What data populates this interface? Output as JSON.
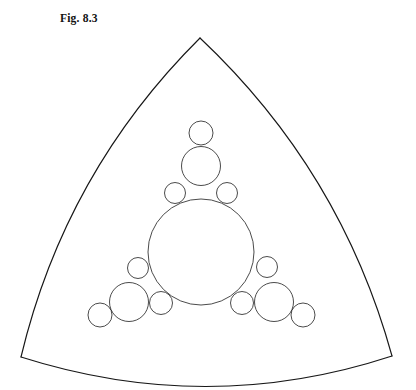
{
  "figure": {
    "caption": "Fig. 8.3",
    "background_color": "#ffffff",
    "stroke_color": "#2b2b2b",
    "boundary_color": "#171717",
    "canvas": {
      "width": 416,
      "height": 390
    }
  },
  "chart_data": {
    "type": "diagram",
    "title": "Fig. 8.3",
    "subtitle": "",
    "xlabel": "",
    "ylabel": "",
    "grid": false,
    "legend": "none",
    "axis_visible": false,
    "cusps": [
      {
        "name": "top-cusp",
        "x": 200,
        "y": 38
      },
      {
        "name": "bottom-left-cusp",
        "x": 21,
        "y": 357
      },
      {
        "name": "bottom-right-cusp",
        "x": 392,
        "y": 356
      }
    ],
    "boundary_arcs": [
      {
        "name": "left-arc",
        "from": "top-cusp",
        "to": "bottom-left-cusp",
        "bulge": 26
      },
      {
        "name": "right-arc",
        "from": "top-cusp",
        "to": "bottom-right-cusp",
        "bulge": 26
      },
      {
        "name": "bottom-arc",
        "from": "bottom-left-cusp",
        "to": "bottom-right-cusp",
        "bulge": 30
      }
    ],
    "circles": [
      {
        "name": "central-circle",
        "cx": 201,
        "cy": 252,
        "r": 53,
        "generation": 0
      },
      {
        "name": "upper-medium-circle",
        "cx": 201,
        "cy": 166,
        "r": 19.5,
        "generation": 1
      },
      {
        "name": "left-medium-circle",
        "cx": 129,
        "cy": 302,
        "r": 19.5,
        "generation": 1
      },
      {
        "name": "right-medium-circle",
        "cx": 274,
        "cy": 302,
        "r": 19.5,
        "generation": 1
      },
      {
        "name": "upper-small-circle",
        "cx": 201,
        "cy": 133,
        "r": 12,
        "generation": 2
      },
      {
        "name": "lower-left-small-circle",
        "cx": 100,
        "cy": 315,
        "r": 12,
        "generation": 2
      },
      {
        "name": "lower-right-small-circle",
        "cx": 303,
        "cy": 315,
        "r": 12,
        "generation": 2
      },
      {
        "name": "upper-left-flank-circle",
        "cx": 175,
        "cy": 193,
        "r": 10.5,
        "generation": 3
      },
      {
        "name": "upper-right-flank-circle",
        "cx": 227,
        "cy": 193,
        "r": 10.5,
        "generation": 3
      },
      {
        "name": "left-upper-flank-circle",
        "cx": 138,
        "cy": 268,
        "r": 10.5,
        "generation": 3
      },
      {
        "name": "left-lower-flank-circle",
        "cx": 161,
        "cy": 303,
        "r": 11.5,
        "generation": 3
      },
      {
        "name": "right-upper-flank-circle",
        "cx": 267,
        "cy": 267,
        "r": 10.5,
        "generation": 3
      },
      {
        "name": "right-lower-flank-circle",
        "cx": 242,
        "cy": 303,
        "r": 11.5,
        "generation": 3
      }
    ],
    "circle_count": 13
  }
}
